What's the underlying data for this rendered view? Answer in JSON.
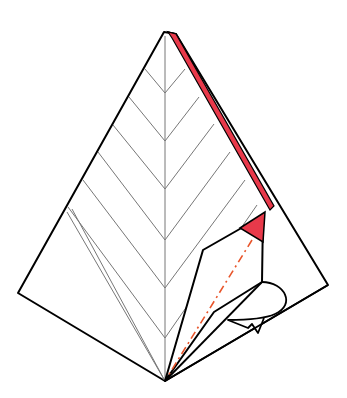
{
  "diagram": {
    "type": "origami-step",
    "colors": {
      "outline": "#000000",
      "crease": "#777777",
      "colored_side": "#e8394a",
      "mountain_fold_line": "#e8552b",
      "paper": "#ffffff"
    },
    "chevron_count": 6
  }
}
